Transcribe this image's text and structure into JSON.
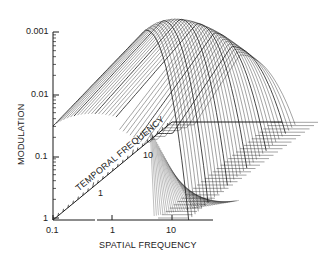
{
  "chart_data": {
    "type": "surface",
    "title": "",
    "xlabel": "SPATIAL FREQUENCY",
    "ylabel": "MODULATION",
    "zlabel": "TEMPORAL FREQUENCY",
    "x_scale": "log",
    "y_scale": "log (inverted: 1 at bottom, 0.001 at top)",
    "x_ticks": [
      "0.1",
      "1",
      "10"
    ],
    "y_ticks": [
      "0.001",
      "0.01",
      "0.1",
      "1"
    ],
    "temporal_ticks": [
      "1",
      "10"
    ],
    "xlim": [
      0.1,
      30
    ],
    "ylim": [
      1,
      0.001
    ],
    "grid": false,
    "legend": null
  },
  "axes": {
    "y_title": "MODULATION",
    "x_title": "SPATIAL FREQUENCY",
    "t_title": "TEMPORAL FREQUENCY",
    "y_ticks": [
      {
        "label": "0.001",
        "y": 32
      },
      {
        "label": "0.01",
        "y": 95
      },
      {
        "label": "0.1",
        "y": 157
      },
      {
        "label": "1",
        "y": 218
      }
    ],
    "x_ticks": [
      {
        "label": "0.1",
        "x": 53
      },
      {
        "label": "1",
        "x": 112
      },
      {
        "label": "10",
        "x": 172
      }
    ],
    "t_ticks": [
      {
        "label": "1"
      },
      {
        "label": "10"
      }
    ]
  },
  "colors": {
    "ink": "#1a1a1a",
    "background": "#ffffff"
  }
}
